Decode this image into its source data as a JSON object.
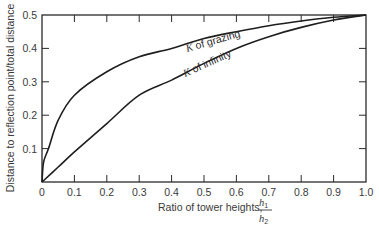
{
  "chart_data": {
    "type": "line",
    "title": "",
    "xlabel": "Ratio of tower heights,",
    "xlabel_fraction": {
      "numerator": "h",
      "numerator_sub": "1",
      "denominator": "h",
      "denominator_sub": "2"
    },
    "ylabel": "Distance to reflection point/total distance",
    "xlim": [
      0,
      1.0
    ],
    "ylim": [
      0,
      0.5
    ],
    "xticks": [
      "0",
      "0.1",
      "0.2",
      "0.3",
      "0.4",
      "0.5",
      "0.6",
      "0.7",
      "0.8",
      "0.9",
      "1.0"
    ],
    "yticks": [
      "0",
      "0.1",
      "0.2",
      "0.3",
      "0.4",
      "0.5"
    ],
    "grid": false,
    "legend": "inline curve labels",
    "series": [
      {
        "name": "K of grazing",
        "label_prefix": "K",
        "label_suffix": " of grazing",
        "x": [
          0,
          0.005,
          0.02,
          0.05,
          0.1,
          0.2,
          0.3,
          0.4,
          0.5,
          0.6,
          0.7,
          0.8,
          0.9,
          1.0
        ],
        "values": [
          0,
          0.06,
          0.1,
          0.185,
          0.26,
          0.33,
          0.375,
          0.4,
          0.43,
          0.45,
          0.468,
          0.482,
          0.493,
          0.5
        ]
      },
      {
        "name": "K of infinity",
        "label_prefix": "K",
        "label_suffix": " of infinity",
        "x": [
          0,
          0.05,
          0.1,
          0.2,
          0.3,
          0.4,
          0.5,
          0.6,
          0.7,
          0.8,
          0.9,
          1.0
        ],
        "values": [
          0,
          0.045,
          0.09,
          0.175,
          0.26,
          0.305,
          0.355,
          0.4,
          0.435,
          0.463,
          0.485,
          0.5
        ]
      }
    ]
  }
}
